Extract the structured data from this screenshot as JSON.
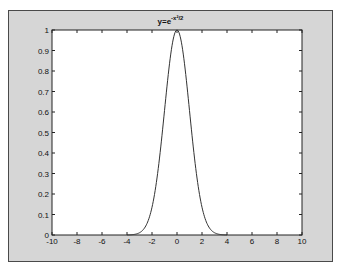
{
  "chart_data": {
    "type": "line",
    "title_base": "y=e",
    "title_exponent": "-x²/2",
    "xlabel": "",
    "ylabel": "",
    "xlim": [
      -10,
      10
    ],
    "ylim": [
      0,
      1
    ],
    "xticks": [
      -10,
      -8,
      -6,
      -4,
      -2,
      0,
      2,
      4,
      6,
      8,
      10
    ],
    "yticks": [
      0,
      0.1,
      0.2,
      0.3,
      0.4,
      0.5,
      0.6,
      0.7,
      0.8,
      0.9,
      1
    ],
    "xtick_labels": [
      "-10",
      "-8",
      "-6",
      "-4",
      "-2",
      "0",
      "2",
      "4",
      "6",
      "8",
      "10"
    ],
    "ytick_labels": [
      "0",
      "0.1",
      "0.2",
      "0.3",
      "0.4",
      "0.5",
      "0.6",
      "0.7",
      "0.8",
      "0.9",
      "1"
    ],
    "grid": false,
    "legend": null,
    "series": [
      {
        "name": "y=e^{-x^2/2}",
        "color": "#333333",
        "x": [
          -4,
          -3.5,
          -3,
          -2.5,
          -2,
          -1.5,
          -1,
          -0.5,
          0,
          0.5,
          1,
          1.5,
          2,
          2.5,
          3,
          3.5,
          4
        ],
        "y": [
          0.0003,
          0.0022,
          0.0111,
          0.0439,
          0.1353,
          0.3247,
          0.6065,
          0.8825,
          1.0,
          0.8825,
          0.6065,
          0.3247,
          0.1353,
          0.0439,
          0.0111,
          0.0022,
          0.0003
        ]
      }
    ]
  },
  "colors": {
    "figure_bg": "#d6d6d6",
    "axes_bg": "#ffffff",
    "line": "#333333"
  }
}
